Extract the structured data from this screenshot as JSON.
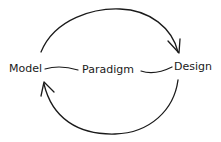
{
  "diagram": {
    "type": "cycle",
    "nodes": [
      {
        "id": "model",
        "label": "Model"
      },
      {
        "id": "paradigm",
        "label": "Paradigm"
      },
      {
        "id": "design",
        "label": "Design"
      }
    ],
    "edges": [
      {
        "from": "model",
        "to": "design",
        "style": "curved-arrow-top"
      },
      {
        "from": "design",
        "to": "model",
        "style": "curved-arrow-bottom"
      },
      {
        "from": "model",
        "to": "paradigm",
        "style": "line"
      },
      {
        "from": "paradigm",
        "to": "design",
        "style": "line"
      }
    ],
    "stroke_color": "#1a1a1a",
    "background": "#ffffff"
  }
}
